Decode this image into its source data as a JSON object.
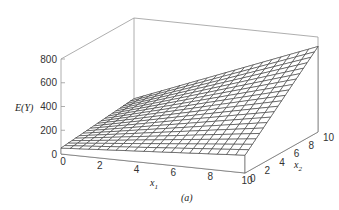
{
  "chart_data": {
    "type": "surface",
    "title": "",
    "caption": "(a)",
    "xlabel": "x1",
    "ylabel": "x2",
    "zlabel": "E(Y)",
    "x_ticks": [
      "0",
      "2",
      "4",
      "6",
      "8",
      "10"
    ],
    "y_ticks": [
      "0",
      "2",
      "4",
      "6",
      "8",
      "10"
    ],
    "z_ticks": [
      "0",
      "200",
      "400",
      "600",
      "800"
    ],
    "xlim": [
      0,
      10
    ],
    "ylim": [
      0,
      10
    ],
    "zlim": [
      0,
      800
    ],
    "grid_resolution": 20,
    "surface_corners": [
      {
        "x1": 0,
        "x2": 0,
        "E": 50
      },
      {
        "x1": 10,
        "x2": 0,
        "E": 150
      },
      {
        "x1": 0,
        "x2": 10,
        "E": 120
      },
      {
        "x1": 10,
        "x2": 10,
        "E": 720
      }
    ],
    "model": "E(Y) = 50 + 10 x1 + 7 x2 + 5 x1 x2"
  },
  "labels": {
    "z_axis": "E(Y)",
    "x_axis": "x",
    "x_sub": "1",
    "y_axis": "x",
    "y_sub": "2",
    "caption": "(a)"
  }
}
